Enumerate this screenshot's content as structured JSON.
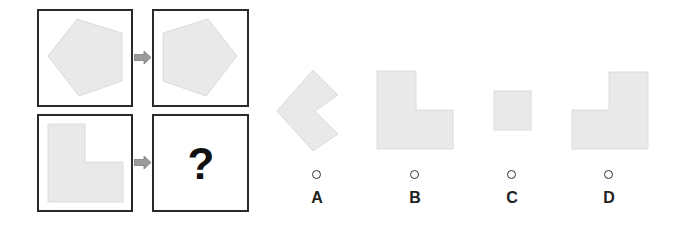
{
  "puzzle": {
    "question_mark": "?",
    "colors": {
      "shape_fill": "#e9e9e9",
      "shape_stroke": "#dcdcdc",
      "panel_border": "#2a2a2a",
      "arrow_fill": "#9a9a9a"
    },
    "grid": [
      {
        "row": 1,
        "left": "pentagon",
        "right": "pentagon-mirrored"
      },
      {
        "row": 2,
        "left": "l-shape",
        "right": "unknown"
      }
    ]
  },
  "options": [
    {
      "label": "A",
      "shape": "chevron-left"
    },
    {
      "label": "B",
      "shape": "l-shape"
    },
    {
      "label": "C",
      "shape": "square"
    },
    {
      "label": "D",
      "shape": "l-shape-mirrored"
    }
  ]
}
